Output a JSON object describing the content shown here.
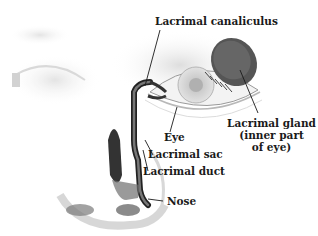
{
  "diagram": {
    "labels": {
      "canaliculus": "Lacrimal canaliculus",
      "gland_line1": "Lacrimal gland",
      "gland_line2": "(inner part",
      "gland_line3": "of eye)",
      "eye": "Eye",
      "sac": "Lacrimal sac",
      "duct": "Lacrimal duct",
      "nose": "Nose"
    },
    "colors": {
      "line": "#1a1a1a",
      "shade_dark": "#3a3a3a",
      "shade_mid": "#8a8a8a",
      "shade_light": "#d8d8d8"
    }
  }
}
